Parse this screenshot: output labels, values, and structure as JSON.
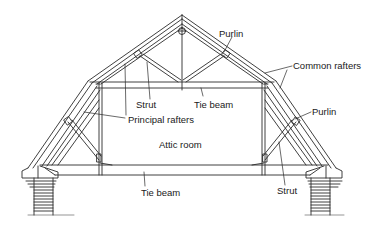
{
  "figure": {
    "colors": {
      "line": "#2a2a2a",
      "background": "#ffffff",
      "text": "#1a1a1a"
    }
  },
  "labels": {
    "purlin_top": "Purlin",
    "common_rafters": "Common rafters",
    "strut_upper": "Strut",
    "tie_beam_upper": "Tie beam",
    "principal_rafters": "Principal rafters",
    "attic_room": "Attic room",
    "purlin_right": "Purlin",
    "tie_beam_lower": "Tie beam",
    "strut_lower": "Strut"
  }
}
